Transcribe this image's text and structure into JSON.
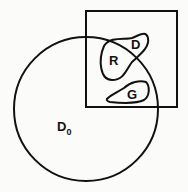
{
  "diagram": {
    "type": "set-region diagram",
    "stroke_color": "#111111",
    "background_color": "#fbfbf9",
    "shapes": {
      "circle": {
        "label": "D",
        "subscript": "0"
      },
      "square": {
        "label": ""
      },
      "blob_upper": {
        "labels": [
          "R",
          "D"
        ]
      },
      "blob_lower": {
        "label": "G"
      }
    },
    "labels": {
      "d0_main": "D",
      "d0_sub": "0",
      "r": "R",
      "d": "D",
      "g": "G"
    }
  }
}
